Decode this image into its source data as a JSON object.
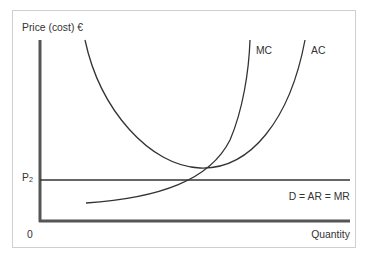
{
  "diagram": {
    "type": "economics-cost-curves",
    "y_axis_label": "Price (cost) €",
    "x_axis_label": "Quantity",
    "origin_label": "0",
    "price_level": {
      "label": "P",
      "subscript": "2"
    },
    "curves": [
      {
        "name": "MC",
        "label": "MC",
        "shape": "rising, convex"
      },
      {
        "name": "AC",
        "label": "AC",
        "shape": "U-shaped"
      },
      {
        "name": "demand",
        "label": "D = AR = MR",
        "shape": "horizontal at P2"
      }
    ],
    "colors": {
      "axis": "#555555",
      "curve": "#333333",
      "text": "#333333",
      "frame": "#cfcfcf"
    }
  }
}
